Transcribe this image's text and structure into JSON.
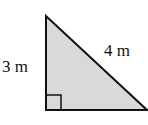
{
  "diagram": {
    "type": "right-triangle",
    "labels": {
      "vertical_leg": "3 m",
      "hypotenuse": "4 m"
    },
    "colors": {
      "fill": "#d9d9d9",
      "stroke": "#111111"
    },
    "right_angle_marker": true
  }
}
